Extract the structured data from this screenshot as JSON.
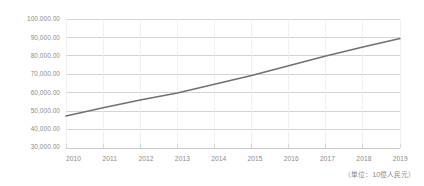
{
  "chart_data": {
    "type": "line",
    "title": "",
    "xlabel": "",
    "ylabel": "",
    "annotation": "（単位：10億人民元）",
    "grid": true,
    "legend_position": "none",
    "series_color": "#707070",
    "grid_color": "#c9c9c9",
    "vgrid_color": "#ededed",
    "tick_label_color": "#8a8a8a",
    "categories": [
      "2010",
      "2011",
      "2012",
      "2013",
      "2014",
      "2015",
      "2016",
      "2017",
      "2018",
      "2019"
    ],
    "x": [
      2010,
      2011,
      2012,
      2013,
      2014,
      2015,
      2016,
      2017,
      2018,
      2019
    ],
    "ylim": [
      30000,
      100000
    ],
    "yticks": [
      30000,
      40000,
      50000,
      60000,
      70000,
      80000,
      90000,
      100000
    ],
    "ytick_labels": [
      "30,000.00",
      "40,000.00",
      "50,000.00",
      "60,000.00",
      "70,000.00",
      "80,000.00",
      "90,000.00",
      "100,000.00"
    ],
    "series": [
      {
        "name": "",
        "values": [
          47500,
          52000,
          56200,
          60000,
          64700,
          69400,
          74700,
          80000,
          84800,
          89500
        ]
      }
    ]
  },
  "axis": {
    "ytick_0": "30,000.00",
    "ytick_1": "40,000.00",
    "ytick_2": "50,000.00",
    "ytick_3": "60,000.00",
    "ytick_4": "70,000.00",
    "ytick_5": "80,000.00",
    "ytick_6": "90,000.00",
    "ytick_7": "100,000.00",
    "xtick_0": "2010",
    "xtick_1": "2011",
    "xtick_2": "2012",
    "xtick_3": "2013",
    "xtick_4": "2014",
    "xtick_5": "2015",
    "xtick_6": "2016",
    "xtick_7": "2017",
    "xtick_8": "2018",
    "xtick_9": "2019"
  },
  "footer": {
    "unit_note": "（単位：10億人民元）"
  }
}
